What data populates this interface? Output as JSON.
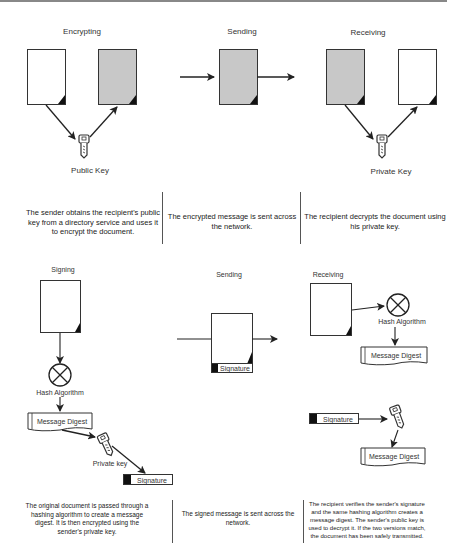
{
  "encryption": {
    "stages": [
      {
        "title": "Encrypting",
        "description": "The sender obtains the recipient's public key from a directory service and uses it to encrypt the document."
      },
      {
        "title": "Sending",
        "description": "The encrypted message is sent across the network."
      },
      {
        "title": "Receiving",
        "description": "The recipient decrypts the document using his private key."
      }
    ],
    "key_labels": {
      "public": "Public Key",
      "private": "Private Key"
    }
  },
  "signing": {
    "stages": [
      {
        "title": "Signing",
        "description": "The original document is passed through a hashing algorithm to create a message digest. It is then encrypted using the sender's private key."
      },
      {
        "title": "Sending",
        "description": "The signed message is sent across the network."
      },
      {
        "title": "Receiving",
        "description": "The recipient verifies the sender's signature and the same hashing algorithm creates a message digest. The sender's public key is used to decrypt it. If the two versions match, the document has been safely transmitted."
      }
    ],
    "labels": {
      "hash_algorithm": "Hash Algorithm",
      "message_digest": "Message Digest",
      "private_key": "Private key",
      "signature": "Signature"
    }
  },
  "colors": {
    "encrypted_doc": "#c8c8c8",
    "plain_doc": "#ffffff",
    "line": "#222222"
  }
}
